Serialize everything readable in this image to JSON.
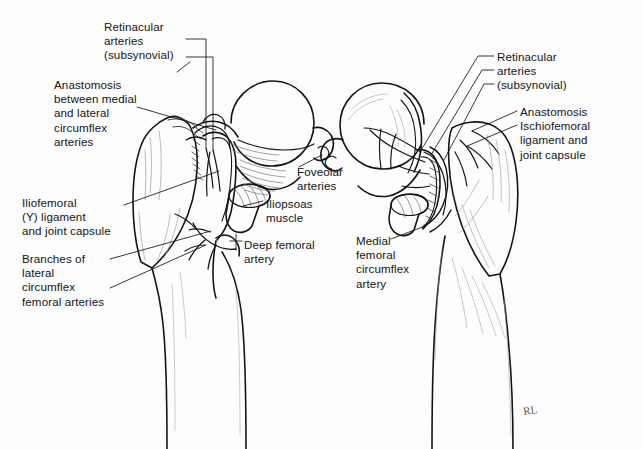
{
  "figure": {
    "kind": "anatomical-line-illustration",
    "background_color": "#fdfdfd",
    "ink_color": "#141414",
    "shading_color": "#8a8a8a",
    "signature": "RL"
  },
  "labels": {
    "retinacular_left": {
      "text": "Retinacular\narteries\n(subsynovial)",
      "align": "left",
      "x": 104,
      "y": 20
    },
    "anastomosis_left": {
      "text": "Anastomosis\nbetween medial\nand lateral\ncircumflex\narteries",
      "align": "left",
      "x": 54,
      "y": 78
    },
    "iliofemoral": {
      "text": "Iliofemoral\n(Y) ligament\nand joint capsule",
      "align": "left",
      "x": 22,
      "y": 196
    },
    "branches_lateral": {
      "text": "Branches of\nlateral\ncircumflex\nfemoral arteries",
      "align": "left",
      "x": 22,
      "y": 252
    },
    "foveolar": {
      "text": "Foveolar\narteries",
      "align": "left",
      "x": 297,
      "y": 165
    },
    "iliopsoas": {
      "text": "Iliopsoas\nmuscle",
      "align": "left",
      "x": 266,
      "y": 197
    },
    "deep_femoral": {
      "text": "Deep femoral\nartery",
      "align": "left",
      "x": 244,
      "y": 238
    },
    "medial_circumflex": {
      "text": "Medial\nfemoral\ncircumflex\nartery",
      "align": "left",
      "x": 356,
      "y": 234
    },
    "retinacular_right": {
      "text": "Retinacular\narteries\n(subsynovial)",
      "align": "left",
      "x": 497,
      "y": 50
    },
    "anastomosis_right": {
      "text": "Anastomosis\nIschiofemoral\nligament and\njoint capsule",
      "align": "left",
      "x": 520,
      "y": 105
    }
  },
  "leader_lines": {
    "retinacular_left": [
      "M 186 39 L 206 39 L 206 148",
      "M 186 57 L 213 57 L 213 150",
      "M 178 73 L 190 64"
    ],
    "anastomosis_left": [
      "M 136 107 L 215 130"
    ],
    "iliofemoral": [
      "M 124 204 L 218 172"
    ],
    "branches_lateral": [
      "M 124 258 L 210 232",
      "M 124 272 L 205 245"
    ],
    "foveolar": [
      "M 300 168 L 322 154"
    ],
    "iliopsoas": [
      "M 263 201 L 243 207"
    ],
    "deep_femoral": [
      "M 241 241 L 232 241",
      "M 236 235 L 236 249"
    ],
    "medial_circumflex": [
      "M 390 238 L 424 226"
    ],
    "retinacular_right": [
      "M 494 55 L 476 55 L 421 152",
      "M 494 69 L 480 69 L 432 155",
      "M 494 82 L 482 82 L 444 158"
    ],
    "anastomosis_right": [
      "M 517 110 L 472 131",
      "M 517 124 L 467 146"
    ]
  },
  "anatomy": {
    "left_view": {
      "name": "anterior-view-proximal-femur",
      "parts": [
        "femoral-head",
        "femoral-neck",
        "greater-trochanter",
        "femoral-shaft",
        "iliopsoas-muscle",
        "joint-capsule",
        "retinacular-vessels"
      ]
    },
    "right_view": {
      "name": "posterior-view-proximal-femur",
      "parts": [
        "femoral-head",
        "femoral-neck",
        "greater-trochanter",
        "femoral-shaft",
        "joint-capsule",
        "retinacular-vessels",
        "medial-circumflex-artery"
      ]
    }
  }
}
